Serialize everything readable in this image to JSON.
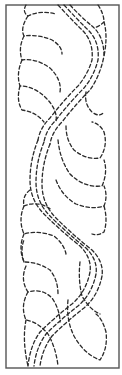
{
  "figure": {
    "type": "quilting-border-stencil",
    "frame": {
      "x": 6,
      "y": 5,
      "width": 113,
      "height": 363,
      "color": "#555555"
    },
    "stitch_color": "#2a2a2a",
    "line_style": "dashed"
  }
}
